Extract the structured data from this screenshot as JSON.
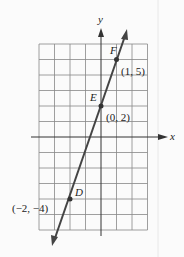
{
  "diagram": {
    "type": "coordinate-graph",
    "axes": {
      "x_label": "x",
      "y_label": "y"
    },
    "grid": {
      "x_min": -4,
      "x_max": 3,
      "y_min": -6,
      "y_max": 6
    },
    "line": {
      "slope": 3,
      "intercept": 2,
      "color": "#444444"
    },
    "points": [
      {
        "name": "F",
        "coords_label": "(1, 5)",
        "x": 1,
        "y": 5
      },
      {
        "name": "E",
        "coords_label": "(0, 2)",
        "x": 0,
        "y": 2
      },
      {
        "name": "D",
        "coords_label": "(−2, −4)",
        "x": -2,
        "y": -4
      }
    ]
  }
}
